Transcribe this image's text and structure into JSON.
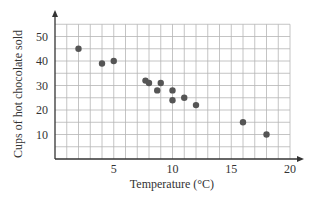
{
  "chart_data": {
    "type": "scatter",
    "title": "",
    "xlabel": "Temperature (°C)",
    "ylabel": "Cups of hot chocolate sold",
    "xlim": [
      0,
      20
    ],
    "ylim": [
      0,
      55
    ],
    "x_ticks": [
      5,
      10,
      15,
      20
    ],
    "y_ticks": [
      10,
      20,
      30,
      40,
      50
    ],
    "grid": true,
    "grid_step_x": 1,
    "grid_step_y": 5,
    "legend": null,
    "marker_color": "#555555",
    "series": [
      {
        "name": "Cups sold",
        "points": [
          {
            "x": 2,
            "y": 45
          },
          {
            "x": 4,
            "y": 39
          },
          {
            "x": 5,
            "y": 40
          },
          {
            "x": 7.7,
            "y": 32
          },
          {
            "x": 8,
            "y": 31
          },
          {
            "x": 9,
            "y": 31
          },
          {
            "x": 8.7,
            "y": 28
          },
          {
            "x": 10,
            "y": 28
          },
          {
            "x": 10,
            "y": 24
          },
          {
            "x": 11,
            "y": 25
          },
          {
            "x": 12,
            "y": 22
          },
          {
            "x": 16,
            "y": 15
          },
          {
            "x": 18,
            "y": 10
          }
        ]
      }
    ]
  }
}
